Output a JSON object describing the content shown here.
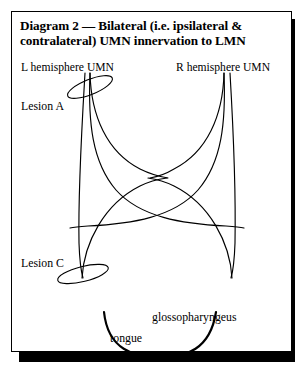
{
  "figure": {
    "title": "Diagram 2 — Bilateral (i.e. ipsilateral & contralateral) UMN innervation to LMN",
    "background_color": "#ffffff",
    "ink_color": "#000000",
    "frame": {
      "border_color": "#000000",
      "shadow_color": "#000000"
    }
  },
  "labels": {
    "left_umn": "L hemisphere UMN",
    "right_umn": "R hemisphere UMN",
    "lesion_a": "Lesion A",
    "lesion_c": "Lesion C",
    "glossopharyngeus": "glossopharyngeus",
    "tongue": "tongue"
  },
  "diagram": {
    "type": "anatomical-schematic",
    "tracts": [
      {
        "name": "left-ipsilateral-fibre",
        "side": "left",
        "from": "L hemisphere UMN",
        "to": "left LMN",
        "crosses_midline": false
      },
      {
        "name": "left-contralateral-fibre",
        "side": "left",
        "from": "L hemisphere UMN",
        "to": "right LMN",
        "crosses_midline": true
      },
      {
        "name": "right-ipsilateral-fibre",
        "side": "right",
        "from": "R hemisphere UMN",
        "to": "right LMN",
        "crosses_midline": false
      },
      {
        "name": "right-contralateral-fibre",
        "side": "right",
        "from": "R hemisphere UMN",
        "to": "left LMN",
        "crosses_midline": true
      }
    ],
    "lesions": [
      {
        "name": "Lesion A",
        "shape": "ellipse",
        "position": "upper left tract",
        "rotation_deg": -22
      },
      {
        "name": "Lesion C",
        "shape": "ellipse",
        "position": "lower left tract",
        "rotation_deg": -16
      }
    ],
    "target_structures": [
      "tongue",
      "glossopharyngeus"
    ]
  }
}
